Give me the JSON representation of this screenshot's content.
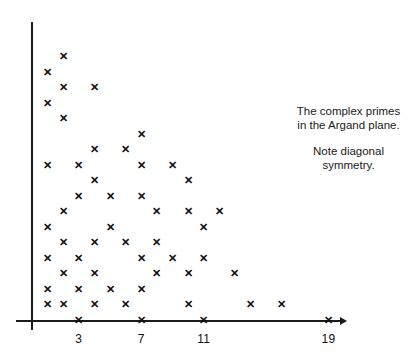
{
  "figure": {
    "title_note": "The complex primes\nin the Argand plane.",
    "secondary_note": "Note diagonal\nsymmetry.",
    "marker_glyph": "✕",
    "axis_color": "#1a1a1a",
    "marker_color": "#111111",
    "background": "#ffffff"
  },
  "axes": {
    "x": {
      "origin_px": 32,
      "step_px": 15.6,
      "tick_values": [
        3,
        7,
        11,
        19
      ],
      "tick_labels": [
        "3",
        "7",
        "11",
        "19"
      ],
      "min": 0,
      "max": 20,
      "has_arrow": true
    },
    "y": {
      "origin_px": 320,
      "step_px": 15.5,
      "tick_values": [],
      "tick_labels": [],
      "min": 0,
      "max": 19,
      "has_arrow": false
    }
  },
  "chart_data": {
    "type": "scatter",
    "title": "The complex primes in the Argand plane.",
    "subtitle": "Note diagonal symmetry.",
    "xlabel": "",
    "ylabel": "",
    "xlim": [
      0,
      20
    ],
    "ylim": [
      0,
      19
    ],
    "xticks": [
      3,
      7,
      11,
      19
    ],
    "yticks": [],
    "grid": false,
    "legend": false,
    "marker": "x",
    "series_name": "Gaussian primes (first quadrant)",
    "points": [
      [
        3,
        0
      ],
      [
        7,
        0
      ],
      [
        11,
        0
      ],
      [
        19,
        0
      ],
      [
        1,
        1
      ],
      [
        2,
        1
      ],
      [
        4,
        1
      ],
      [
        6,
        1
      ],
      [
        10,
        1
      ],
      [
        14,
        1
      ],
      [
        16,
        1
      ],
      [
        1,
        2
      ],
      [
        3,
        2
      ],
      [
        5,
        2
      ],
      [
        7,
        2
      ],
      [
        2,
        3
      ],
      [
        4,
        3
      ],
      [
        8,
        3
      ],
      [
        10,
        3
      ],
      [
        13,
        3
      ],
      [
        1,
        4
      ],
      [
        3,
        4
      ],
      [
        7,
        4
      ],
      [
        9,
        4
      ],
      [
        11,
        4
      ],
      [
        2,
        5
      ],
      [
        4,
        5
      ],
      [
        6,
        5
      ],
      [
        8,
        5
      ],
      [
        1,
        6
      ],
      [
        5,
        6
      ],
      [
        11,
        6
      ],
      [
        2,
        7
      ],
      [
        8,
        7
      ],
      [
        10,
        7
      ],
      [
        12,
        7
      ],
      [
        3,
        8
      ],
      [
        5,
        8
      ],
      [
        7,
        8
      ],
      [
        4,
        9
      ],
      [
        10,
        9
      ],
      [
        1,
        10
      ],
      [
        3,
        10
      ],
      [
        7,
        10
      ],
      [
        9,
        10
      ],
      [
        4,
        11
      ],
      [
        6,
        11
      ],
      [
        7,
        12
      ],
      [
        2,
        13
      ],
      [
        1,
        14
      ],
      [
        2,
        15
      ],
      [
        4,
        15
      ],
      [
        1,
        16
      ],
      [
        2,
        17
      ]
    ]
  },
  "notes": {
    "line_1": "The complex primes",
    "line_2": "in the Argand plane.",
    "line_3": "Note diagonal",
    "line_4": "symmetry."
  }
}
